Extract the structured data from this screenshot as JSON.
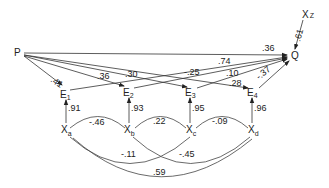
{
  "diagram": {
    "type": "path-diagram",
    "nodes": {
      "P": {
        "label": "P"
      },
      "Q": {
        "label": "Q"
      },
      "Xz": {
        "label": "X",
        "sub": "Z"
      },
      "E1": {
        "label": "E",
        "sub": "1"
      },
      "E2": {
        "label": "E",
        "sub": "2"
      },
      "E3": {
        "label": "E",
        "sub": "3"
      },
      "E4": {
        "label": "E",
        "sub": "4"
      },
      "Xa": {
        "label": "X",
        "sub": "a"
      },
      "Xb": {
        "label": "X",
        "sub": "b"
      },
      "Xc": {
        "label": "X",
        "sub": "c"
      },
      "Xd": {
        "label": "X",
        "sub": "d"
      }
    },
    "edges": {
      "P_Q": ".36",
      "P_E1": ".41",
      "P_E2": ".36",
      "P_E3": ".30",
      "P_E4": ".28",
      "E1_Q": ".74",
      "E2_Q": "-.25",
      "E3_Q": ".10",
      "E4_Q": "-.37",
      "Xz_Q": ".61",
      "Xa_E1": ".91",
      "Xb_E2": ".93",
      "Xc_E3": ".95",
      "Xd_E4": ".96"
    },
    "correlations": {
      "Xa_Xb": "-.46",
      "Xb_Xc": ".22",
      "Xc_Xd": "-.09",
      "Xa_Xc": "-.11",
      "Xb_Xd": "-.45",
      "Xa_Xd": ".59"
    }
  }
}
